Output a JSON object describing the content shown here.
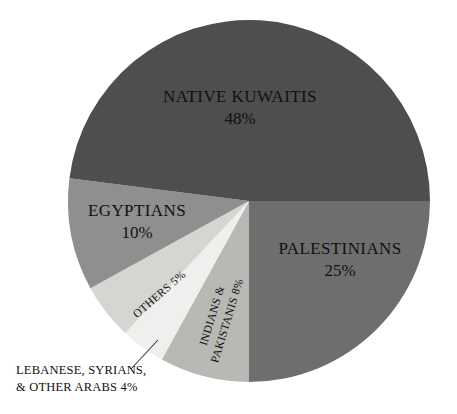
{
  "chart_data": {
    "type": "pie",
    "title": "",
    "subtitle": "",
    "xlabel": "",
    "ylabel": "",
    "legend_position": "none",
    "grid": false,
    "start_angle_deg": 0,
    "direction": "clockwise",
    "categories": [
      "PALESTINIANS",
      "INDIANS & PAKISTANIS",
      "LEBANESE, SYRIANS, & OTHER ARABS",
      "OTHERS",
      "EGYPTIANS",
      "NATIVE KUWAITIS"
    ],
    "values": [
      25,
      8,
      4,
      5,
      10,
      48
    ],
    "value_labels": [
      "25%",
      "8%",
      "4%",
      "5%",
      "10%",
      "48%"
    ],
    "colors": [
      "#6e6e6e",
      "#b8b8b4",
      "#f0efed",
      "#d5d5d2",
      "#8f8f8f",
      "#4e4e4e"
    ]
  },
  "pie_geometry": {
    "center_x": 249,
    "center_y": 201,
    "radius": 181
  },
  "slices": {
    "palestinians": {
      "name": "PALESTINIANS",
      "percent_label": "25%",
      "value": 25,
      "color": "#6e6e6e",
      "label_x": 340,
      "label_y": 250,
      "pct_x": 340,
      "pct_y": 272,
      "rotation": 0
    },
    "indians_pakistanis": {
      "line1": "INDIANS &",
      "line2": "PAKISTANIS 8%",
      "value": 8,
      "color": "#b8b8b4",
      "label_x": 224,
      "label_y": 320,
      "rotation": -73
    },
    "lebanese_syrians": {
      "line1": "LEBANESE, SYRIANS,",
      "line2": "& OTHER ARABS 4%",
      "value": 4,
      "color": "#f0efed",
      "caption_x": 16,
      "caption_y": 374,
      "leader_from_x": 158,
      "leader_from_y": 340,
      "leader_to_x": 131,
      "leader_to_y": 369
    },
    "others": {
      "label": "OTHERS 5%",
      "value": 5,
      "color": "#d5d5d2",
      "label_x": 160,
      "label_y": 295,
      "rotation": -41
    },
    "egyptians": {
      "name": "EGYPTIANS",
      "percent_label": "10%",
      "value": 10,
      "color": "#8f8f8f",
      "label_x": 137,
      "label_y": 212,
      "pct_x": 137,
      "pct_y": 234,
      "rotation": 0
    },
    "native_kuwaitis": {
      "name": "NATIVE KUWAITIS",
      "percent_label": "48%",
      "value": 48,
      "color": "#4e4e4e",
      "label_x": 240,
      "label_y": 98,
      "pct_x": 240,
      "pct_y": 120,
      "rotation": 0
    }
  },
  "colors": {
    "background": "#ffffff",
    "text": "#111111",
    "leader_line": "#3a3a3a"
  }
}
